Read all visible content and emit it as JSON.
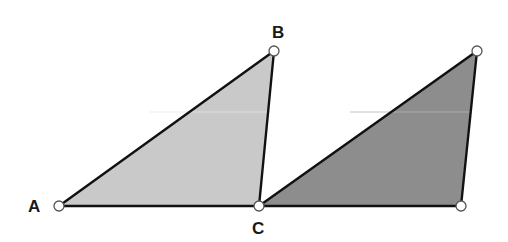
{
  "diagram": {
    "type": "geometry",
    "colors": {
      "background": "#ffffff",
      "light_fill": "#c9c9c9",
      "dark_fill": "#8d8d8d",
      "edge": "#111111",
      "vertex_fill": "#ffffff"
    },
    "points": {
      "A": {
        "x": 59,
        "y": 206,
        "label": "A"
      },
      "B": {
        "x": 274,
        "y": 51,
        "label": "B"
      },
      "C": {
        "x": 259,
        "y": 206,
        "label": "C"
      },
      "D": {
        "x": 477,
        "y": 51,
        "label": ""
      },
      "E": {
        "x": 461,
        "y": 206,
        "label": ""
      }
    },
    "triangles": [
      {
        "name": "triangle-ABC",
        "vertices": [
          "A",
          "B",
          "C"
        ],
        "fill": "light"
      },
      {
        "name": "triangle-CDE",
        "vertices": [
          "C",
          "D",
          "E"
        ],
        "fill": "dark"
      }
    ],
    "labels": {
      "A": "A",
      "B": "B",
      "C": "C"
    }
  }
}
